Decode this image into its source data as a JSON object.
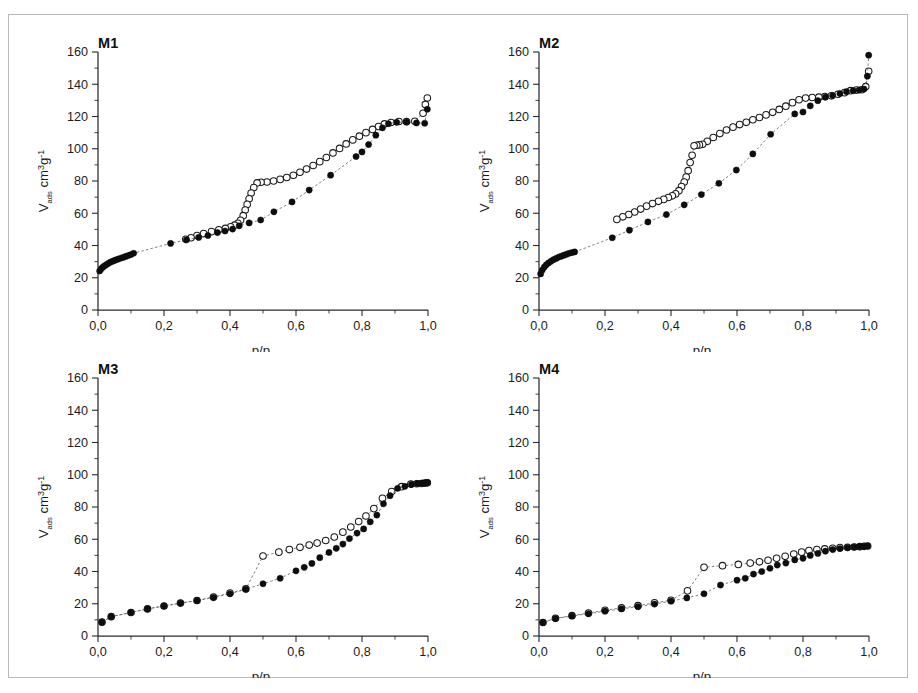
{
  "figure": {
    "background_color": "#ffffff",
    "frame_color": "#b9b9b9",
    "marker_filled_color": "#0d0d0d",
    "marker_open_color": "#ffffff",
    "marker_outline_color": "#1a1a1a"
  },
  "axis": {
    "x_title_main": "p/p",
    "x_title_sub": "0",
    "y_title_v": "V",
    "y_title_ads": "ads",
    "y_title_cm": " cm",
    "y_title_cube": "3",
    "y_title_g": "g",
    "y_title_inv": "-1",
    "x_ticklabels": [
      "0,0",
      "0,2",
      "0,4",
      "0,6",
      "0,8",
      "1,0"
    ],
    "x_tickvalues": [
      0.0,
      0.2,
      0.4,
      0.6,
      0.8,
      1.0
    ],
    "y_ticklabels": [
      "0",
      "20",
      "40",
      "60",
      "80",
      "100",
      "120",
      "140",
      "160"
    ],
    "y_tickvalues": [
      0,
      20,
      40,
      60,
      80,
      100,
      120,
      140,
      160
    ],
    "xlim": [
      0.0,
      1.0
    ],
    "ylim": [
      0,
      160
    ],
    "x_minor_step": 0.1,
    "y_minor_step": 10
  },
  "panels": [
    {
      "id": "M1",
      "label": "M1"
    },
    {
      "id": "M2",
      "label": "M2"
    },
    {
      "id": "M3",
      "label": "M3"
    },
    {
      "id": "M4",
      "label": "M4"
    }
  ],
  "chart_data": [
    {
      "type": "scatter",
      "title": "M1",
      "xlabel": "p/p0",
      "ylabel": "Vads cm3 g-1",
      "xlim": [
        0.0,
        1.0
      ],
      "ylim": [
        0,
        160
      ],
      "grid": false,
      "legend": "none",
      "series": [
        {
          "name": "adsorption",
          "marker": "filled-circle",
          "x": [
            0.005,
            0.01,
            0.015,
            0.02,
            0.026,
            0.032,
            0.038,
            0.045,
            0.052,
            0.06,
            0.068,
            0.076,
            0.084,
            0.092,
            0.1,
            0.108,
            0.22,
            0.268,
            0.305,
            0.333,
            0.362,
            0.385,
            0.408,
            0.428,
            0.458,
            0.493,
            0.533,
            0.588,
            0.64,
            0.705,
            0.782,
            0.8,
            0.82,
            0.842,
            0.862,
            0.88,
            0.905,
            0.935,
            0.965,
            0.99,
            0.998
          ],
          "y": [
            24.2,
            25.6,
            26.6,
            27.4,
            28.2,
            29.0,
            29.7,
            30.3,
            30.9,
            31.5,
            32.1,
            32.6,
            33.2,
            33.8,
            34.4,
            35.2,
            41.3,
            43.5,
            45.0,
            46.2,
            48.0,
            49.0,
            50.2,
            52.2,
            54.0,
            55.8,
            60.9,
            67.0,
            74.4,
            83.6,
            95.2,
            98.0,
            102.6,
            108.4,
            113.0,
            115.5,
            116.4,
            116.6,
            116.0,
            115.8,
            124.5
          ]
        },
        {
          "name": "desorption",
          "marker": "open-circle",
          "x": [
            0.998,
            0.992,
            0.985,
            0.96,
            0.935,
            0.912,
            0.888,
            0.868,
            0.85,
            0.832,
            0.812,
            0.792,
            0.772,
            0.752,
            0.732,
            0.712,
            0.692,
            0.672,
            0.652,
            0.632,
            0.612,
            0.592,
            0.572,
            0.552,
            0.532,
            0.512,
            0.494,
            0.482,
            0.472,
            0.464,
            0.458,
            0.452,
            0.446,
            0.44,
            0.432,
            0.424,
            0.414,
            0.402,
            0.386,
            0.366,
            0.344,
            0.32,
            0.3,
            0.282,
            0.266
          ],
          "y": [
            131.5,
            127.5,
            122.0,
            117.0,
            116.8,
            116.9,
            116.3,
            115.4,
            113.8,
            112.0,
            110.0,
            107.8,
            105.5,
            103.0,
            100.2,
            97.4,
            94.6,
            92.0,
            89.6,
            87.4,
            85.4,
            83.6,
            82.2,
            81.0,
            80.0,
            79.4,
            79.2,
            78.8,
            76.0,
            72.5,
            69.0,
            65.5,
            62.0,
            58.5,
            55.6,
            53.8,
            52.6,
            51.6,
            50.6,
            49.8,
            48.6,
            47.4,
            46.2,
            44.8,
            43.8
          ]
        }
      ]
    },
    {
      "type": "scatter",
      "title": "M2",
      "xlabel": "p/p0",
      "ylabel": "Vads cm3 g-1",
      "xlim": [
        0.0,
        1.0
      ],
      "ylim": [
        0,
        160
      ],
      "grid": false,
      "legend": "none",
      "series": [
        {
          "name": "adsorption",
          "marker": "filled-circle",
          "x": [
            0.005,
            0.01,
            0.016,
            0.022,
            0.029,
            0.036,
            0.044,
            0.052,
            0.06,
            0.068,
            0.076,
            0.084,
            0.092,
            0.1,
            0.108,
            0.222,
            0.274,
            0.33,
            0.386,
            0.44,
            0.492,
            0.545,
            0.598,
            0.648,
            0.702,
            0.775,
            0.8,
            0.822,
            0.845,
            0.868,
            0.89,
            0.912,
            0.932,
            0.952,
            0.97,
            0.985,
            0.995,
            0.999
          ],
          "y": [
            22.4,
            24.8,
            26.6,
            28.0,
            29.2,
            30.2,
            31.2,
            32.0,
            32.8,
            33.4,
            34.0,
            34.6,
            35.2,
            35.6,
            36.0,
            44.8,
            49.5,
            54.6,
            59.2,
            65.2,
            71.6,
            78.6,
            86.8,
            96.8,
            109.0,
            121.6,
            122.8,
            126.6,
            129.8,
            132.0,
            133.0,
            134.2,
            135.4,
            136.0,
            136.4,
            137.0,
            145.0,
            158.0
          ]
        },
        {
          "name": "desorption",
          "marker": "open-circle",
          "x": [
            0.999,
            0.99,
            0.978,
            0.962,
            0.944,
            0.926,
            0.906,
            0.886,
            0.866,
            0.848,
            0.828,
            0.808,
            0.788,
            0.768,
            0.748,
            0.728,
            0.708,
            0.688,
            0.668,
            0.648,
            0.628,
            0.608,
            0.588,
            0.568,
            0.548,
            0.528,
            0.51,
            0.496,
            0.486,
            0.478,
            0.47,
            0.464,
            0.458,
            0.452,
            0.446,
            0.44,
            0.432,
            0.424,
            0.414,
            0.404,
            0.392,
            0.378,
            0.362,
            0.344,
            0.326,
            0.308,
            0.29,
            0.272,
            0.254,
            0.236
          ],
          "y": [
            148.0,
            138.5,
            136.6,
            136.4,
            136.0,
            134.8,
            133.8,
            132.8,
            132.4,
            132.0,
            131.8,
            131.4,
            130.4,
            128.6,
            126.4,
            124.4,
            122.6,
            121.0,
            119.4,
            118.0,
            116.4,
            115.0,
            113.4,
            111.6,
            109.4,
            107.0,
            104.6,
            102.8,
            102.4,
            102.2,
            101.8,
            96.0,
            91.4,
            86.4,
            82.4,
            79.4,
            76.6,
            74.0,
            72.0,
            70.8,
            69.8,
            68.6,
            67.4,
            66.0,
            64.4,
            62.6,
            60.8,
            59.2,
            57.8,
            56.2
          ]
        }
      ]
    },
    {
      "type": "scatter",
      "title": "M3",
      "xlabel": "p/p0",
      "ylabel": "Vads cm3 g-1",
      "xlim": [
        0.0,
        1.0
      ],
      "ylim": [
        0,
        160
      ],
      "grid": false,
      "legend": "none",
      "series": [
        {
          "name": "adsorption",
          "marker": "filled-circle",
          "x": [
            0.012,
            0.04,
            0.1,
            0.15,
            0.2,
            0.25,
            0.3,
            0.35,
            0.4,
            0.448,
            0.5,
            0.552,
            0.6,
            0.625,
            0.648,
            0.672,
            0.7,
            0.722,
            0.742,
            0.762,
            0.785,
            0.805,
            0.825,
            0.845,
            0.865,
            0.885,
            0.908,
            0.93,
            0.95,
            0.968,
            0.982,
            0.992,
            0.998
          ],
          "y": [
            8.6,
            12.0,
            14.6,
            16.8,
            18.6,
            20.4,
            22.0,
            23.8,
            26.2,
            29.0,
            32.4,
            35.8,
            40.4,
            42.6,
            45.0,
            48.6,
            51.8,
            54.4,
            57.0,
            60.4,
            63.8,
            66.4,
            70.8,
            75.0,
            82.0,
            87.0,
            91.6,
            92.8,
            94.0,
            94.6,
            94.8,
            95.0,
            95.2
          ]
        },
        {
          "name": "desorption",
          "marker": "open-circle",
          "x": [
            0.998,
            0.99,
            0.98,
            0.966,
            0.948,
            0.92,
            0.89,
            0.862,
            0.836,
            0.812,
            0.79,
            0.766,
            0.742,
            0.716,
            0.69,
            0.664,
            0.64,
            0.612,
            0.58,
            0.548,
            0.5,
            0.448,
            0.4,
            0.35,
            0.3,
            0.25,
            0.2,
            0.15,
            0.1,
            0.04,
            0.012
          ],
          "y": [
            95.0,
            94.8,
            94.6,
            94.4,
            94.2,
            92.6,
            89.6,
            85.4,
            79.0,
            74.4,
            71.0,
            67.6,
            64.4,
            61.4,
            59.2,
            57.6,
            56.4,
            55.0,
            53.6,
            52.0,
            49.6,
            29.2,
            26.6,
            24.2,
            22.0,
            20.4,
            18.6,
            16.8,
            14.6,
            12.0,
            8.6
          ]
        }
      ]
    },
    {
      "type": "scatter",
      "title": "M4",
      "xlabel": "p/p0",
      "ylabel": "Vads cm3 g-1",
      "xlim": [
        0.0,
        1.0
      ],
      "ylim": [
        0,
        160
      ],
      "grid": false,
      "legend": "none",
      "series": [
        {
          "name": "adsorption",
          "marker": "filled-circle",
          "x": [
            0.012,
            0.05,
            0.1,
            0.15,
            0.2,
            0.25,
            0.3,
            0.35,
            0.4,
            0.448,
            0.5,
            0.55,
            0.6,
            0.625,
            0.65,
            0.675,
            0.7,
            0.722,
            0.748,
            0.775,
            0.8,
            0.822,
            0.845,
            0.868,
            0.89,
            0.912,
            0.935,
            0.955,
            0.972,
            0.985,
            0.996
          ],
          "y": [
            8.4,
            10.8,
            12.4,
            13.8,
            15.4,
            16.8,
            18.2,
            19.8,
            21.6,
            23.6,
            26.2,
            31.6,
            34.6,
            35.8,
            38.4,
            40.0,
            42.0,
            44.0,
            45.2,
            47.2,
            48.2,
            50.0,
            51.2,
            52.6,
            53.6,
            54.2,
            54.8,
            55.2,
            55.4,
            55.6,
            55.8
          ]
        },
        {
          "name": "desorption",
          "marker": "open-circle",
          "x": [
            0.996,
            0.985,
            0.972,
            0.955,
            0.935,
            0.912,
            0.89,
            0.866,
            0.842,
            0.818,
            0.796,
            0.772,
            0.746,
            0.72,
            0.694,
            0.668,
            0.64,
            0.604,
            0.556,
            0.5,
            0.45,
            0.4,
            0.35,
            0.3,
            0.25,
            0.2,
            0.15,
            0.1,
            0.05,
            0.012
          ],
          "y": [
            55.8,
            55.6,
            55.4,
            55.2,
            55.0,
            54.8,
            54.4,
            54.0,
            53.6,
            53.0,
            52.0,
            50.8,
            49.4,
            48.2,
            47.0,
            46.0,
            45.2,
            44.4,
            43.6,
            42.6,
            28.0,
            22.2,
            20.6,
            18.8,
            17.4,
            16.0,
            14.2,
            12.6,
            11.0,
            8.4
          ]
        }
      ]
    }
  ]
}
